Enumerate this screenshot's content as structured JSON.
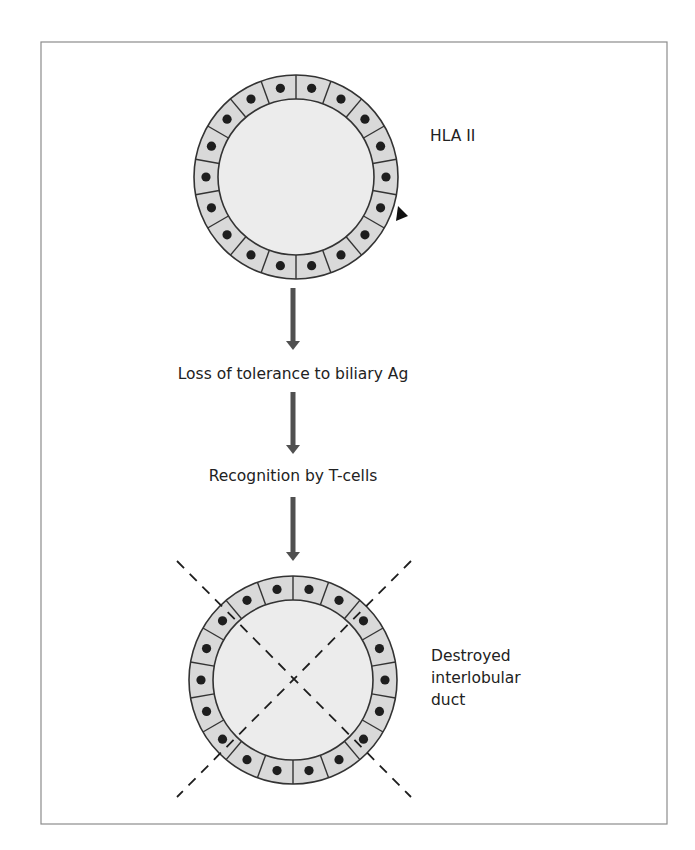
{
  "diagram": {
    "type": "flowchart",
    "colors": {
      "frame": "#8c8c8c",
      "cell_fill": "#d9d9d9",
      "lumen_fill": "#ececec",
      "outline": "#333333",
      "nucleus": "#1e1e1e",
      "arrow": "#505050",
      "text": "#222222"
    },
    "top_duct": {
      "label": "HLA II",
      "cell_count": 18,
      "marker": "triangle-marker"
    },
    "steps": [
      {
        "label": "Loss of tolerance to biliary Ag"
      },
      {
        "label": "Recognition by T-cells"
      }
    ],
    "bottom_duct": {
      "label_lines": [
        "Destroyed",
        "interlobular",
        "duct"
      ],
      "cell_count": 18,
      "crossed_out": true
    }
  }
}
